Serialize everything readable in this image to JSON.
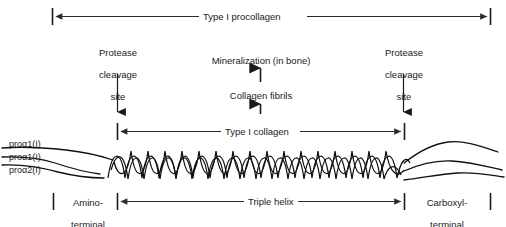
{
  "figure": {
    "colors": {
      "ink": "#1a1a1a",
      "line": "#2b2b2b",
      "background": "#ffffff"
    }
  },
  "measure_bars": {
    "procollagen": {
      "label": "Type I procollagen",
      "left_x": 52,
      "right_x": 491,
      "y": 16
    },
    "collagen": {
      "label": "Type I collagen",
      "left_x": 117,
      "right_x": 404,
      "y": 131
    },
    "triple_helix": {
      "label": "Triple helix",
      "left_x": 117,
      "right_x": 404,
      "y": 201
    }
  },
  "callouts": {
    "protease_left": {
      "line1": "Protease",
      "line2": "cleavage",
      "line3": "site"
    },
    "protease_right": {
      "line1": "Protease",
      "line2": "cleavage",
      "line3": "site"
    },
    "mineralization": "Mineralization (in bone)",
    "collagen_fibrils": "Collagen fibrils"
  },
  "chains": {
    "chain1": "proα1(I)",
    "chain2": "proα1(I)",
    "chain3": "proα2(I)"
  },
  "terminal_peptides": {
    "amino": {
      "line1": "Amino-",
      "line2": "terminal",
      "line3": "peptide"
    },
    "carboxyl": {
      "line1": "Carboxyl-",
      "line2": "terminal",
      "line3": "peptide"
    }
  },
  "caption_fragment": ""
}
